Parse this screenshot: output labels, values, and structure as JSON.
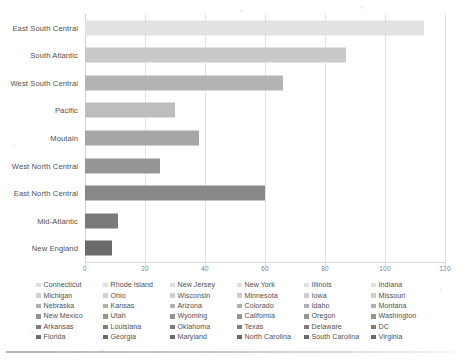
{
  "chart_data": {
    "type": "bar",
    "orientation": "horizontal",
    "title": "",
    "xlabel": "",
    "ylabel": "",
    "xlim": [
      0,
      120
    ],
    "xticks": [
      0,
      20,
      40,
      60,
      80,
      100,
      120
    ],
    "grid": "vertical",
    "categories": [
      "East South Central",
      "South Atlantic",
      "West South Central",
      "Pacific",
      "Moutain",
      "West North Central",
      "East North Central",
      "Mid-Atlantic",
      "New England"
    ],
    "values": [
      113,
      87,
      66,
      30,
      38,
      25,
      60,
      11,
      9
    ],
    "bar_colors": [
      "#e2e2e2",
      "#c9c9c9",
      "#b4b4b4",
      "#bdbdbd",
      "#a6a6a6",
      "#969696",
      "#888888",
      "#7a7a7a",
      "#6b6b6b"
    ]
  },
  "legend": {
    "position": "bottom",
    "columns": 6,
    "rows": 6,
    "entries": [
      {
        "label": "Connecticut",
        "color": "#e0e0e0"
      },
      {
        "label": "Michigan",
        "color": "#cfcfcf"
      },
      {
        "label": "Nebraska",
        "color": "#b0b0b0"
      },
      {
        "label": "New Mexico",
        "color": "#949494"
      },
      {
        "label": "Arkansas",
        "color": "#7e7e7e"
      },
      {
        "label": "Florida",
        "color": "#6a6a6a"
      },
      {
        "label": "Rhode Island",
        "color": "#e0e0e0"
      },
      {
        "label": "Ohio",
        "color": "#cfcfcf"
      },
      {
        "label": "Kansas",
        "color": "#b0b0b0"
      },
      {
        "label": "Utah",
        "color": "#949494"
      },
      {
        "label": "Louisiana",
        "color": "#7e7e7e"
      },
      {
        "label": "Georgia",
        "color": "#6a6a6a"
      },
      {
        "label": "New Jersey",
        "color": "#e0e0e0"
      },
      {
        "label": "Wisconsin",
        "color": "#cfcfcf"
      },
      {
        "label": "Arizona",
        "color": "#b0b0b0"
      },
      {
        "label": "Wyoming",
        "color": "#949494"
      },
      {
        "label": "Oklahoma",
        "color": "#7e7e7e"
      },
      {
        "label": "Maryland",
        "color": "#6a6a6a"
      },
      {
        "label": "New York",
        "color": "#e0e0e0"
      },
      {
        "label": "Minnesota",
        "color": "#cfcfcf"
      },
      {
        "label": "Colorado",
        "color": "#b0b0b0"
      },
      {
        "label": "California",
        "color": "#949494"
      },
      {
        "label": "Texas",
        "color": "#7e7e7e"
      },
      {
        "label": "North Carolina",
        "color": "#6a6a6a"
      },
      {
        "label": "Illinois",
        "color": "#e0e0e0"
      },
      {
        "label": "Iowa",
        "color": "#cfcfcf"
      },
      {
        "label": "Idaho",
        "color": "#b0b0b0"
      },
      {
        "label": "Oregon",
        "color": "#949494"
      },
      {
        "label": "Delaware",
        "color": "#7e7e7e"
      },
      {
        "label": "South Carolina",
        "color": "#6a6a6a"
      },
      {
        "label": "Indiana",
        "color": "#e0e0e0"
      },
      {
        "label": "Missouri",
        "color": "#cfcfcf"
      },
      {
        "label": "Montana",
        "color": "#b0b0b0"
      },
      {
        "label": "Washington",
        "color": "#949494"
      },
      {
        "label": "DC",
        "color": "#7e7e7e"
      },
      {
        "label": "Virginia",
        "color": "#6a6a6a"
      }
    ]
  }
}
